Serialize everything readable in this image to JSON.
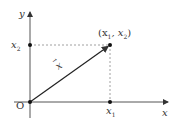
{
  "diagram": {
    "type": "vector-on-cartesian-plane",
    "axes": {
      "x_label": "x",
      "y_label": "y",
      "origin_label": "O"
    },
    "point": {
      "label_open": "(x",
      "sub1": "1",
      "comma": ",  x",
      "sub2": "2",
      "label_close": ")"
    },
    "ticks": {
      "x_tick": {
        "base": "x",
        "sub": "1"
      },
      "y_tick": {
        "base": "x",
        "sub": "2"
      }
    },
    "vector_label": "x",
    "colors": {
      "axis": "#444444",
      "vector": "#222222",
      "dashed": "#777777",
      "text": "#333333"
    }
  }
}
